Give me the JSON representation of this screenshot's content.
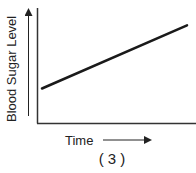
{
  "chart_data": {
    "type": "line",
    "title": "",
    "caption": "( 3 )",
    "xlabel": "Time",
    "ylabel": "Blood Sugar Level",
    "x": [
      0,
      1
    ],
    "series": [
      {
        "name": "Blood Sugar Level",
        "values": [
          0.3,
          0.85
        ]
      }
    ],
    "xlim": [
      0,
      1
    ],
    "ylim": [
      0,
      1
    ],
    "grid": false,
    "legend": "none",
    "axis_arrows": true,
    "colors": {
      "line": "#1a1a1a",
      "axes": "#333333"
    }
  }
}
